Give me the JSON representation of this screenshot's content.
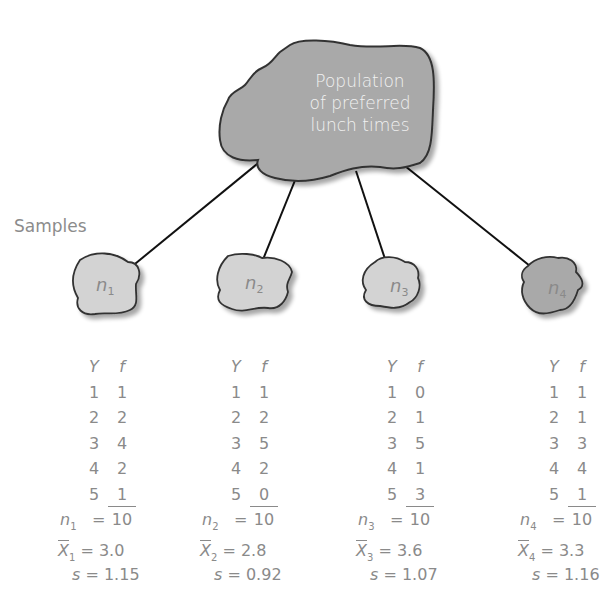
{
  "population": {
    "label_lines": [
      "Population",
      "of preferred",
      "lunch times"
    ],
    "fill_color": "#a9a9a9",
    "outline_color": "#333333"
  },
  "samples_label": "Samples",
  "sample_blob_fill": "#d3d3d3",
  "samples": [
    {
      "id": "n1",
      "sub": "1",
      "table_headers": {
        "y": "Y",
        "f": "f"
      },
      "rows": [
        {
          "y": "1",
          "f": "1"
        },
        {
          "y": "2",
          "f": "2"
        },
        {
          "y": "3",
          "f": "4"
        },
        {
          "y": "4",
          "f": "2"
        },
        {
          "y": "5",
          "f": "1"
        }
      ],
      "n_total": "10",
      "mean": "3.0",
      "s": "1.15"
    },
    {
      "id": "n2",
      "sub": "2",
      "table_headers": {
        "y": "Y",
        "f": "f"
      },
      "rows": [
        {
          "y": "1",
          "f": "1"
        },
        {
          "y": "2",
          "f": "2"
        },
        {
          "y": "3",
          "f": "5"
        },
        {
          "y": "4",
          "f": "2"
        },
        {
          "y": "5",
          "f": "0"
        }
      ],
      "n_total": "10",
      "mean": "2.8",
      "s": "0.92"
    },
    {
      "id": "n3",
      "sub": "3",
      "table_headers": {
        "y": "Y",
        "f": "f"
      },
      "rows": [
        {
          "y": "1",
          "f": "0"
        },
        {
          "y": "2",
          "f": "1"
        },
        {
          "y": "3",
          "f": "5"
        },
        {
          "y": "4",
          "f": "1"
        },
        {
          "y": "5",
          "f": "3"
        }
      ],
      "n_total": "10",
      "mean": "3.6",
      "s": "1.07"
    },
    {
      "id": "n4",
      "sub": "4",
      "table_headers": {
        "y": "Y",
        "f": "f"
      },
      "rows": [
        {
          "y": "1",
          "f": "1"
        },
        {
          "y": "2",
          "f": "1"
        },
        {
          "y": "3",
          "f": "3"
        },
        {
          "y": "4",
          "f": "4"
        },
        {
          "y": "5",
          "f": "1"
        }
      ],
      "n_total": "10",
      "mean": "3.3",
      "s": "1.16"
    }
  ],
  "symbols": {
    "n": "n",
    "x": "X",
    "s": "s",
    "equals": "="
  }
}
